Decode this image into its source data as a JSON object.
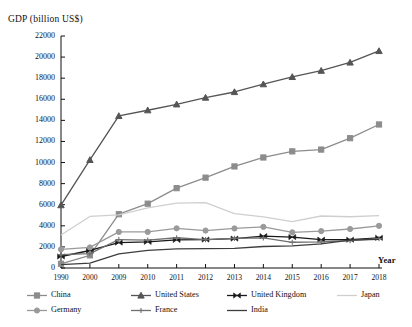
{
  "chart_data": {
    "type": "line",
    "title": "",
    "ylabel": "GDP (billion US$)",
    "xlabel": "Year",
    "grid": false,
    "legend_position": "bottom",
    "ylim": [
      0,
      22000
    ],
    "ytick_step": 2000,
    "yticks": [
      "0",
      "2000",
      "4000",
      "6000",
      "8000",
      "10000",
      "12000",
      "14000",
      "16000",
      "18000",
      "20000",
      "22000"
    ],
    "categories": [
      "1990",
      "2000",
      "2009",
      "2010",
      "2011",
      "2012",
      "2013",
      "2014",
      "2015",
      "2016",
      "2017",
      "2018"
    ],
    "series": [
      {
        "name": "China",
        "marker": "square",
        "color": "#8c8c8c",
        "values": [
          400,
          1200,
          5100,
          6100,
          7570,
          8570,
          9630,
          10480,
          11060,
          11230,
          12310,
          13610
        ]
      },
      {
        "name": "United States",
        "marker": "triangle",
        "color": "#555555",
        "values": [
          5960,
          10250,
          14420,
          14960,
          15520,
          16160,
          16690,
          17430,
          18120,
          18710,
          19490,
          20580
        ]
      },
      {
        "name": "United Kingdom",
        "marker": "bowtie",
        "color": "#1a1a1a",
        "values": [
          1090,
          1660,
          2410,
          2480,
          2660,
          2700,
          2790,
          3020,
          2930,
          2690,
          2680,
          2860
        ]
      },
      {
        "name": "Japan",
        "marker": "none",
        "color": "#cfcfcf",
        "values": [
          3130,
          4890,
          5030,
          5700,
          6160,
          6200,
          5160,
          4850,
          4390,
          4930,
          4860,
          4970
        ]
      },
      {
        "name": "Germany",
        "marker": "circle",
        "color": "#9a9a9a",
        "values": [
          1770,
          1950,
          3420,
          3420,
          3760,
          3550,
          3750,
          3900,
          3380,
          3500,
          3700,
          4000
        ]
      },
      {
        "name": "France",
        "marker": "plus",
        "color": "#707070",
        "values": [
          1270,
          1370,
          2700,
          2650,
          2870,
          2690,
          2810,
          2860,
          2440,
          2470,
          2590,
          2780
        ]
      },
      {
        "name": "India",
        "marker": "none",
        "color": "#3d3d3d",
        "values": [
          320,
          470,
          1340,
          1680,
          1820,
          1830,
          1860,
          2040,
          2100,
          2290,
          2650,
          2720
        ]
      }
    ]
  },
  "legend": {
    "row1": [
      "China",
      "United States",
      "United Kingdom",
      "Japan"
    ],
    "row2": [
      "Germany",
      "France",
      "India"
    ]
  }
}
